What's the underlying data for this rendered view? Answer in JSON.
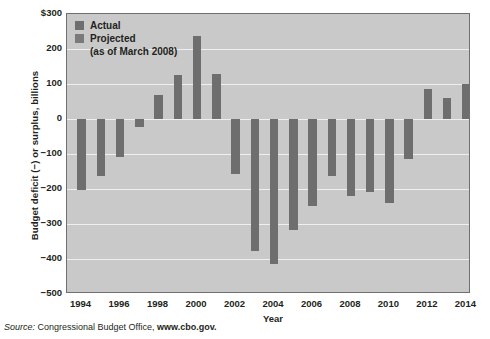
{
  "chart_data": {
    "type": "bar",
    "title": "",
    "xlabel": "Year",
    "ylabel": "Budget deficit (−) or surplus, billions",
    "ylim": [
      -500,
      300
    ],
    "yticks": [
      300,
      200,
      100,
      0,
      -100,
      -200,
      -300,
      -400,
      -500
    ],
    "ytick_labels": [
      "$300",
      "200",
      "100",
      "0",
      "−100",
      "−200",
      "−300",
      "−400",
      "−500"
    ],
    "xticks": [
      1994,
      1996,
      1998,
      2000,
      2002,
      2004,
      2006,
      2008,
      2010,
      2012,
      2014
    ],
    "xtick_labels": [
      "1994",
      "1996",
      "1998",
      "2000",
      "2002",
      "2004",
      "2006",
      "2008",
      "2010",
      "2012",
      "2014"
    ],
    "grid": true,
    "legend_position": "top-left",
    "categories": [
      1994,
      1995,
      1996,
      1997,
      1998,
      1999,
      2000,
      2001,
      2002,
      2003,
      2004,
      2005,
      2006,
      2007,
      2008,
      2009,
      2010,
      2011,
      2012,
      2013,
      2014
    ],
    "values": [
      -203,
      -164,
      -107,
      -22,
      69,
      126,
      236,
      128,
      -158,
      -378,
      -413,
      -318,
      -248,
      -162,
      -219,
      -207,
      -241,
      -115,
      87,
      61,
      101
    ],
    "series": [
      {
        "name": "Actual",
        "color": "#6e6e6e",
        "points": [
          {
            "x": 1994,
            "y": -203
          },
          {
            "x": 1995,
            "y": -164
          },
          {
            "x": 1996,
            "y": -107
          },
          {
            "x": 1997,
            "y": -22
          },
          {
            "x": 1998,
            "y": 69
          },
          {
            "x": 1999,
            "y": 126
          },
          {
            "x": 2000,
            "y": 236
          },
          {
            "x": 2001,
            "y": 128
          },
          {
            "x": 2002,
            "y": -158
          },
          {
            "x": 2003,
            "y": -378
          },
          {
            "x": 2004,
            "y": -413
          },
          {
            "x": 2005,
            "y": -318
          },
          {
            "x": 2006,
            "y": -248
          },
          {
            "x": 2007,
            "y": -162
          }
        ]
      },
      {
        "name": "Projected (as of March 2008)",
        "color": "#6e6e6e",
        "points": [
          {
            "x": 2008,
            "y": -219
          },
          {
            "x": 2009,
            "y": -207
          },
          {
            "x": 2010,
            "y": -241
          },
          {
            "x": 2011,
            "y": -115
          },
          {
            "x": 2012,
            "y": 87
          },
          {
            "x": 2013,
            "y": 61
          },
          {
            "x": 2014,
            "y": 101
          }
        ]
      }
    ]
  },
  "legend": {
    "items": [
      {
        "label": "Actual",
        "color": "#6e6e6e"
      },
      {
        "label": "Projected",
        "color": "#7a7a7a"
      }
    ],
    "subtitle": "(as of March 2008)"
  },
  "axes": {
    "y_title": "Budget deficit (−) or surplus, billions",
    "x_title": "Year"
  },
  "source": {
    "label": "Source:",
    "text": "Congressional Budget Office,",
    "url": "www.cbo.gov."
  },
  "colors": {
    "plot_background": "#c9c9c9",
    "bar": "#6e6e6e",
    "gridline": "#efefef",
    "frame": "#6f6f6f",
    "page_background": "#ffffff",
    "text": "#231f20"
  }
}
